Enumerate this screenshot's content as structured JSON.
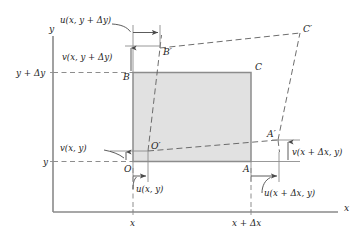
{
  "figure": {
    "type": "continuum-strain-deformation-diagram",
    "background_color": "#ffffff"
  },
  "axes": {
    "x_axis_label": "x",
    "y_axis_label": "y",
    "x_ticks": [
      {
        "id": "x0",
        "label": "x"
      },
      {
        "id": "x1",
        "label": "x + Δx"
      }
    ],
    "y_ticks": [
      {
        "id": "y0",
        "label": "y"
      },
      {
        "id": "y1",
        "label": "y + Δy"
      }
    ]
  },
  "undeformed_element": {
    "name": "original-rectangle",
    "fill_color": "#dcdcdc",
    "edge_color": "#8c8c8c",
    "vertices": [
      {
        "id": "O",
        "label": "O",
        "role": "bottom-left"
      },
      {
        "id": "A",
        "label": "A",
        "role": "bottom-right"
      },
      {
        "id": "C",
        "label": "C",
        "role": "top-right"
      },
      {
        "id": "B",
        "label": "B",
        "role": "top-left"
      }
    ]
  },
  "deformed_element": {
    "name": "deformed-quadrilateral",
    "edge_color": "#5d5d5d",
    "line_style": "dashed",
    "vertices": [
      {
        "id": "Oprime",
        "label": "O′",
        "role": "bottom-left"
      },
      {
        "id": "Aprime",
        "label": "A′",
        "role": "bottom-right"
      },
      {
        "id": "Cprime",
        "label": "C′",
        "role": "top-right"
      },
      {
        "id": "Bprime",
        "label": "B′",
        "role": "top-left"
      }
    ]
  },
  "displacement_labels": [
    {
      "id": "u-x-y-plus-dy",
      "text": "u(x, y + Δy)",
      "component": "u",
      "point": "B",
      "direction": "horizontal"
    },
    {
      "id": "v-x-y-plus-dy",
      "text": "v(x, y + Δy)",
      "component": "v",
      "point": "B",
      "direction": "vertical"
    },
    {
      "id": "v-x-y",
      "text": "v(x, y)",
      "component": "v",
      "point": "O",
      "direction": "vertical"
    },
    {
      "id": "u-x-y",
      "text": "u(x, y)",
      "component": "u",
      "point": "O",
      "direction": "horizontal"
    },
    {
      "id": "v-x-plus-dx-y",
      "text": "v(x + Δx, y)",
      "component": "v",
      "point": "A",
      "direction": "vertical"
    },
    {
      "id": "u-x-plus-dx-y",
      "text": "u(x + Δx, y)",
      "component": "u",
      "point": "A",
      "direction": "horizontal"
    }
  ]
}
